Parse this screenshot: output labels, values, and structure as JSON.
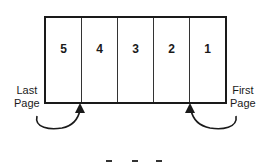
{
  "diagram": {
    "cells": [
      {
        "label": "5"
      },
      {
        "label": "4"
      },
      {
        "label": "3"
      },
      {
        "label": "2"
      },
      {
        "label": "1"
      }
    ],
    "left_label": {
      "line1": "Last",
      "line2": "Page"
    },
    "right_label": {
      "line1": "First",
      "line2": "Page"
    },
    "arrows": [
      {
        "name": "last-page-arrow",
        "from": "Last Page",
        "to": "boundary between 5 and 4"
      },
      {
        "name": "first-page-arrow",
        "from": "First Page",
        "to": "boundary between 2 and 1"
      }
    ],
    "colors": {
      "line": "#1a1a1a",
      "background": "#ffffff"
    }
  }
}
